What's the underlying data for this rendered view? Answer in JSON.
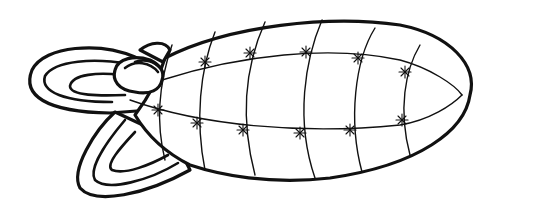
{
  "image": {
    "subject": "Line drawing of a segmented blimp-like body with fins",
    "background_color": "#ffffff",
    "line_color": "#111111"
  }
}
